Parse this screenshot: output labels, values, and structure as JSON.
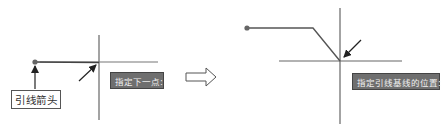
{
  "diagram": {
    "left_panel": {
      "label": "引线箭头",
      "tooltip": "指定下一点:"
    },
    "right_panel": {
      "tooltip": "指定引线基线的位置:"
    },
    "transition_arrow": "hollow-right-arrow",
    "colors": {
      "line": "#555555",
      "tooltip_bg": "#6f6f6f",
      "tooltip_text": "#f2f2f2",
      "dot": "#666666"
    }
  }
}
